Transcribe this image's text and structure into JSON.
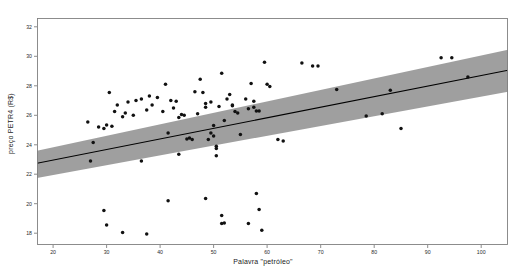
{
  "chart_data": {
    "type": "scatter",
    "title": "",
    "xlabel": "Palavra \"petróleo\"",
    "ylabel": "preço PETR4 (R$)",
    "xlim": [
      17,
      105
    ],
    "ylim": [
      17.2,
      32.6
    ],
    "xticks": [
      20,
      30,
      40,
      50,
      60,
      70,
      80,
      90,
      100
    ],
    "yticks": [
      18,
      20,
      22,
      24,
      26,
      28,
      30,
      32
    ],
    "grid": false,
    "legend": null,
    "marker_color": "#111111",
    "line_color": "#000000",
    "band_color": "#9a9a9a",
    "frame_color": "#808080",
    "background": "#ffffff",
    "regression": {
      "type": "linear",
      "x_start": 17,
      "y_start": 22.75,
      "x_end": 105,
      "y_end": 29.05,
      "band_upper_start": 23.6,
      "band_lower_start": 21.75,
      "band_upper_end": 30.45,
      "band_lower_end": 27.6
    },
    "points": [
      {
        "x": 26.5,
        "y": 25.55
      },
      {
        "x": 27.5,
        "y": 24.15
      },
      {
        "x": 28.5,
        "y": 25.2
      },
      {
        "x": 29.5,
        "y": 25.1
      },
      {
        "x": 30.0,
        "y": 25.35
      },
      {
        "x": 30.5,
        "y": 27.55
      },
      {
        "x": 31.0,
        "y": 25.25
      },
      {
        "x": 31.5,
        "y": 26.25
      },
      {
        "x": 32.0,
        "y": 26.7
      },
      {
        "x": 33.0,
        "y": 25.9
      },
      {
        "x": 33.5,
        "y": 26.15
      },
      {
        "x": 34.0,
        "y": 26.9
      },
      {
        "x": 35.0,
        "y": 26.0
      },
      {
        "x": 35.5,
        "y": 27.0
      },
      {
        "x": 36.5,
        "y": 27.1
      },
      {
        "x": 37.5,
        "y": 26.35
      },
      {
        "x": 38.0,
        "y": 27.3
      },
      {
        "x": 38.5,
        "y": 26.7
      },
      {
        "x": 39.5,
        "y": 27.2
      },
      {
        "x": 40.5,
        "y": 26.25
      },
      {
        "x": 41.0,
        "y": 28.1
      },
      {
        "x": 41.5,
        "y": 24.8
      },
      {
        "x": 42.0,
        "y": 27.0
      },
      {
        "x": 42.5,
        "y": 26.5
      },
      {
        "x": 43.0,
        "y": 26.95
      },
      {
        "x": 43.5,
        "y": 25.85
      },
      {
        "x": 44.0,
        "y": 26.05
      },
      {
        "x": 44.5,
        "y": 26.0
      },
      {
        "x": 45.0,
        "y": 24.4
      },
      {
        "x": 45.5,
        "y": 24.45
      },
      {
        "x": 46.0,
        "y": 24.35
      },
      {
        "x": 46.5,
        "y": 27.6
      },
      {
        "x": 47.0,
        "y": 26.1
      },
      {
        "x": 47.5,
        "y": 28.45
      },
      {
        "x": 48.0,
        "y": 27.55
      },
      {
        "x": 48.5,
        "y": 26.8
      },
      {
        "x": 48.5,
        "y": 26.55
      },
      {
        "x": 49.0,
        "y": 24.35
      },
      {
        "x": 49.5,
        "y": 26.9
      },
      {
        "x": 49.5,
        "y": 24.8
      },
      {
        "x": 50.0,
        "y": 25.3
      },
      {
        "x": 50.0,
        "y": 24.6
      },
      {
        "x": 50.5,
        "y": 23.9
      },
      {
        "x": 50.5,
        "y": 23.75
      },
      {
        "x": 51.0,
        "y": 26.6
      },
      {
        "x": 51.5,
        "y": 28.85
      },
      {
        "x": 52.0,
        "y": 25.65
      },
      {
        "x": 52.5,
        "y": 27.1
      },
      {
        "x": 53.0,
        "y": 27.4
      },
      {
        "x": 53.5,
        "y": 26.65
      },
      {
        "x": 53.5,
        "y": 26.7
      },
      {
        "x": 54.0,
        "y": 26.25
      },
      {
        "x": 54.5,
        "y": 26.15
      },
      {
        "x": 55.0,
        "y": 24.7
      },
      {
        "x": 56.0,
        "y": 27.1
      },
      {
        "x": 56.5,
        "y": 26.45
      },
      {
        "x": 57.0,
        "y": 28.15
      },
      {
        "x": 57.5,
        "y": 26.55
      },
      {
        "x": 57.5,
        "y": 26.95
      },
      {
        "x": 58.0,
        "y": 26.3
      },
      {
        "x": 58.5,
        "y": 26.3
      },
      {
        "x": 59.5,
        "y": 29.6
      },
      {
        "x": 60.0,
        "y": 28.1
      },
      {
        "x": 60.5,
        "y": 27.95
      },
      {
        "x": 62.0,
        "y": 24.35
      },
      {
        "x": 63.0,
        "y": 24.25
      },
      {
        "x": 66.5,
        "y": 29.55
      },
      {
        "x": 68.5,
        "y": 29.35
      },
      {
        "x": 69.5,
        "y": 29.35
      },
      {
        "x": 73.0,
        "y": 27.75
      },
      {
        "x": 78.5,
        "y": 25.95
      },
      {
        "x": 81.5,
        "y": 26.1
      },
      {
        "x": 83.0,
        "y": 27.7
      },
      {
        "x": 85.0,
        "y": 25.1
      },
      {
        "x": 92.5,
        "y": 29.9
      },
      {
        "x": 94.5,
        "y": 29.9
      },
      {
        "x": 97.5,
        "y": 28.6
      },
      {
        "x": 27.0,
        "y": 22.9
      },
      {
        "x": 29.5,
        "y": 19.55
      },
      {
        "x": 30.0,
        "y": 18.55
      },
      {
        "x": 33.0,
        "y": 18.05
      },
      {
        "x": 36.5,
        "y": 22.9
      },
      {
        "x": 37.5,
        "y": 17.95
      },
      {
        "x": 41.5,
        "y": 20.2
      },
      {
        "x": 43.5,
        "y": 23.35
      },
      {
        "x": 48.5,
        "y": 20.35
      },
      {
        "x": 50.5,
        "y": 23.25
      },
      {
        "x": 51.5,
        "y": 19.2
      },
      {
        "x": 51.5,
        "y": 18.65
      },
      {
        "x": 52.0,
        "y": 18.7
      },
      {
        "x": 56.5,
        "y": 18.65
      },
      {
        "x": 58.0,
        "y": 20.7
      },
      {
        "x": 58.5,
        "y": 19.6
      },
      {
        "x": 59.0,
        "y": 18.2
      }
    ]
  }
}
